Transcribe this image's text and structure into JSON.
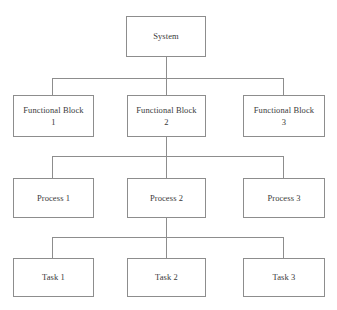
{
  "diagram": {
    "type": "block-hierarchy-tree",
    "background_color": "#ffffff",
    "line_color": "#8d8d8d",
    "text_color": "#3a3a3a",
    "box_fill_color": "#ffffff",
    "levels": [
      {
        "level": 1,
        "name": "system-level",
        "nodes": [
          {
            "id": "system",
            "label": "System",
            "column": "center"
          }
        ]
      },
      {
        "level": 2,
        "name": "functional-block-level",
        "nodes": [
          {
            "id": "functional-block-1",
            "label": "Functional Block\n1",
            "column": "left"
          },
          {
            "id": "functional-block-2",
            "label": "Functional Block\n2",
            "column": "center"
          },
          {
            "id": "functional-block-3",
            "label": "Functional Block\n3",
            "column": "right"
          }
        ]
      },
      {
        "level": 3,
        "name": "process-level",
        "nodes": [
          {
            "id": "process-1",
            "label": "Process 1",
            "column": "left"
          },
          {
            "id": "process-2",
            "label": "Process 2",
            "column": "center"
          },
          {
            "id": "process-3",
            "label": "Process 3",
            "column": "right"
          }
        ]
      },
      {
        "level": 4,
        "name": "task-level",
        "nodes": [
          {
            "id": "task-1",
            "label": "Task 1",
            "column": "left"
          },
          {
            "id": "task-2",
            "label": "Task 2",
            "column": "center"
          },
          {
            "id": "task-3",
            "label": "Task 3",
            "column": "right"
          }
        ]
      }
    ]
  }
}
